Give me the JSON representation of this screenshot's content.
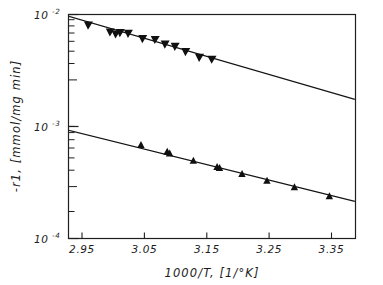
{
  "chart_data": {
    "type": "scatter",
    "title": "",
    "xlabel": "1000/T,  [1/°K]",
    "ylabel": "-r1,  [mmol/mg min]",
    "xlim": [
      2.93,
      3.39
    ],
    "ylim": [
      0.0001,
      0.01
    ],
    "yscale": "log",
    "xscale": "linear",
    "grid": false,
    "legend": null,
    "x_ticks": [
      "2.95",
      "3.05",
      "3.15",
      "3.25",
      "3.35"
    ],
    "x_tick_values": [
      2.95,
      3.05,
      3.15,
      3.25,
      3.35
    ],
    "y_ticks": [
      {
        "base": "10",
        "exp": "-2",
        "value": 0.01
      },
      {
        "base": "10",
        "exp": "-3",
        "value": 0.001
      },
      {
        "base": "10",
        "exp": "-4",
        "value": 0.0001
      }
    ],
    "series": [
      {
        "name": "upper",
        "marker": "triangle-down",
        "color": "#101010",
        "points": [
          {
            "x": 2.962,
            "y": 0.00805
          },
          {
            "x": 2.997,
            "y": 0.007
          },
          {
            "x": 3.006,
            "y": 0.00672
          },
          {
            "x": 3.013,
            "y": 0.0069
          },
          {
            "x": 3.026,
            "y": 0.0068
          },
          {
            "x": 3.049,
            "y": 0.0061
          },
          {
            "x": 3.069,
            "y": 0.006
          },
          {
            "x": 3.085,
            "y": 0.00545
          },
          {
            "x": 3.101,
            "y": 0.0052
          },
          {
            "x": 3.118,
            "y": 0.00468
          },
          {
            "x": 3.14,
            "y": 0.00415
          },
          {
            "x": 3.16,
            "y": 0.004
          }
        ],
        "fit_line": {
          "x1": 2.932,
          "y1": 0.0096,
          "x2": 3.388,
          "y2": 0.00175
        }
      },
      {
        "name": "lower",
        "marker": "triangle-up",
        "color": "#101010",
        "points": [
          {
            "x": 3.046,
            "y": 0.00069
          },
          {
            "x": 3.088,
            "y": 0.0006
          },
          {
            "x": 3.092,
            "y": 0.00058
          },
          {
            "x": 3.13,
            "y": 0.0005
          },
          {
            "x": 3.168,
            "y": 0.00044
          },
          {
            "x": 3.172,
            "y": 0.00043
          },
          {
            "x": 3.208,
            "y": 0.00038
          },
          {
            "x": 3.248,
            "y": 0.00033
          },
          {
            "x": 3.292,
            "y": 0.00029
          },
          {
            "x": 3.348,
            "y": 0.00024
          }
        ],
        "fit_line": {
          "x1": 2.932,
          "y1": 0.00092,
          "x2": 3.388,
          "y2": 0.000215
        }
      }
    ]
  }
}
